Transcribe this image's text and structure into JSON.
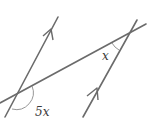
{
  "diagram": {
    "type": "parallel lines cut by a transversal",
    "colors": {
      "line": "#6b6b6b",
      "arc": "#8a8a8a",
      "text": "#3a3a3a",
      "background": "#ffffff"
    },
    "labels": {
      "angle_left": "5x",
      "angle_right": "x"
    },
    "lines": [
      {
        "name": "left-parallel-line",
        "arrow": "single arrowhead pointing up"
      },
      {
        "name": "right-parallel-line",
        "arrow": "single arrowhead pointing up"
      },
      {
        "name": "transversal-line"
      }
    ]
  }
}
